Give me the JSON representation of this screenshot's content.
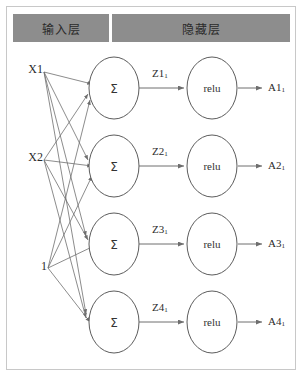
{
  "diagram": {
    "title_band": {
      "input_layer_label": "输入层",
      "hidden_layer_label": "隐藏层"
    },
    "inputs": [
      {
        "label": "X1"
      },
      {
        "label": "X2"
      },
      {
        "label": "1"
      }
    ],
    "neurons": [
      {
        "sum_label": "Σ",
        "z_base": "Z1",
        "z_sub": "1",
        "activation_label": "relu",
        "a_base": "A1",
        "a_sub": "1"
      },
      {
        "sum_label": "Σ",
        "z_base": "Z2",
        "z_sub": "1",
        "activation_label": "relu",
        "a_base": "A2",
        "a_sub": "1"
      },
      {
        "sum_label": "Σ",
        "z_base": "Z3",
        "z_sub": "1",
        "activation_label": "relu",
        "a_base": "A3",
        "a_sub": "1"
      },
      {
        "sum_label": "Σ",
        "z_base": "Z4",
        "z_sub": "1",
        "activation_label": "relu",
        "a_base": "A4",
        "a_sub": "1"
      }
    ],
    "colors": {
      "band_background": "#8d8d8d",
      "band_divider": "#ffffff",
      "node_stroke": "#5c5c5c",
      "edge_stroke": "#6e6e6e",
      "frame_border": "#c8c8c8",
      "page_background": "#ffffff"
    }
  }
}
